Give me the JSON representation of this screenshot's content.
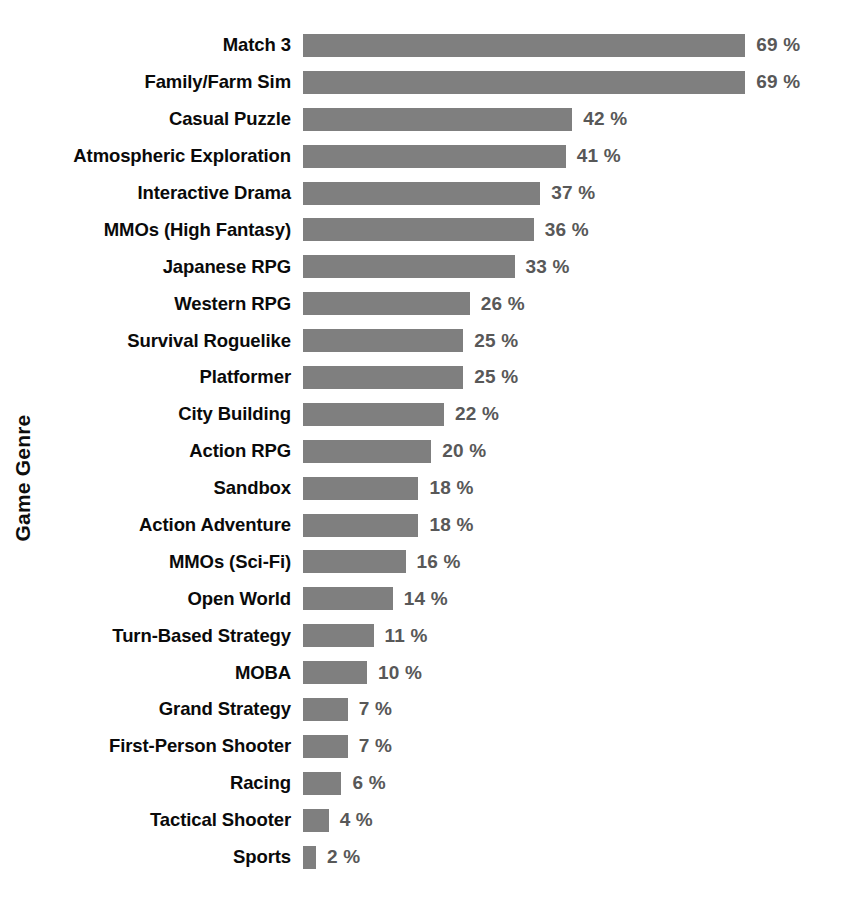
{
  "chart_data": {
    "type": "bar",
    "orientation": "horizontal",
    "title": "",
    "xlabel": "",
    "ylabel": "Game Genre",
    "value_suffix": " %",
    "xlim": [
      0,
      69
    ],
    "grid": false,
    "legend": null,
    "bar_color": "#7f7f7f",
    "label_color": "#0a0a0a",
    "value_color": "#585858",
    "background": "#ffffff",
    "categories": [
      "Match 3",
      "Family/Farm Sim",
      "Casual Puzzle",
      "Atmospheric Exploration",
      "Interactive Drama",
      "MMOs (High Fantasy)",
      "Japanese RPG",
      "Western RPG",
      "Survival Roguelike",
      "Platformer",
      "City Building",
      "Action RPG",
      "Sandbox",
      "Action Adventure",
      "MMOs (Sci-Fi)",
      "Open World",
      "Turn-Based Strategy",
      "MOBA",
      "Grand Strategy",
      "First-Person Shooter",
      "Racing",
      "Tactical Shooter",
      "Sports"
    ],
    "values": [
      69,
      69,
      42,
      41,
      37,
      36,
      33,
      26,
      25,
      25,
      22,
      20,
      18,
      18,
      16,
      14,
      11,
      10,
      7,
      7,
      6,
      4,
      2
    ],
    "value_labels": [
      "69 %",
      "69 %",
      "42 %",
      "41 %",
      "37 %",
      "36 %",
      "33 %",
      "26 %",
      "25 %",
      "25 %",
      "22 %",
      "20 %",
      "18 %",
      "18 %",
      "16 %",
      "14 %",
      "11 %",
      "10 %",
      "7 %",
      "7 %",
      "6 %",
      "4 %",
      "2 %"
    ]
  }
}
